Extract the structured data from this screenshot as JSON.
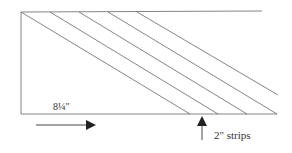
{
  "diagram": {
    "dimension_label": "8¼\"",
    "strips_label": "2\" strips",
    "line_color": "#555555",
    "arrow_color": "#222222"
  }
}
